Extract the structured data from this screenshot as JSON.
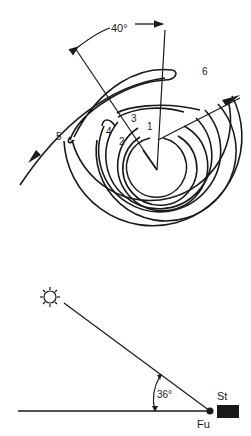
{
  "top_figure": {
    "angle_label": "40°",
    "waypoints": [
      {
        "id": "1",
        "label": "1"
      },
      {
        "id": "2",
        "label": "2"
      },
      {
        "id": "3",
        "label": "3"
      },
      {
        "id": "4",
        "label": "4"
      },
      {
        "id": "5",
        "label": "5"
      },
      {
        "id": "6",
        "label": "6"
      }
    ]
  },
  "bottom_figure": {
    "angle_label": "36°",
    "feeding_site_label": "Fu",
    "hive_label": "St",
    "sun_icon": "sun-icon"
  },
  "colors": {
    "ink": "#1a1a1a",
    "background": "#ffffff"
  }
}
